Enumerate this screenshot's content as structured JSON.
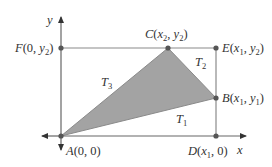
{
  "diagram": {
    "type": "coordinate-geometry",
    "colors": {
      "background": "#ffffff",
      "axis": "#555555",
      "rectangle_line": "#8a8a8a",
      "triangle_fill": "#a3a3a3",
      "point": "#555555",
      "text": "#333333"
    },
    "axes": {
      "x_label": "x",
      "y_label": "y"
    },
    "points": {
      "A": {
        "name": "A",
        "coords": "(0, 0)"
      },
      "B": {
        "name": "B",
        "x": "x",
        "x_sub": "1",
        "y": "y",
        "y_sub": "1"
      },
      "C": {
        "name": "C",
        "x": "x",
        "x_sub": "2",
        "y": "y",
        "y_sub": "2"
      },
      "D": {
        "name": "D",
        "x": "x",
        "x_sub": "1",
        "y_val": "0"
      },
      "E": {
        "name": "E",
        "x": "x",
        "x_sub": "1",
        "y": "y",
        "y_sub": "2"
      },
      "F": {
        "name": "F",
        "x_val": "0",
        "y": "y",
        "y_sub": "2"
      }
    },
    "regions": {
      "T1": {
        "letter": "T",
        "sub": "1"
      },
      "T2": {
        "letter": "T",
        "sub": "2"
      },
      "T3": {
        "letter": "T",
        "sub": "3"
      }
    },
    "punct": {
      "open": "(",
      "close": ")",
      "comma": ", "
    }
  }
}
